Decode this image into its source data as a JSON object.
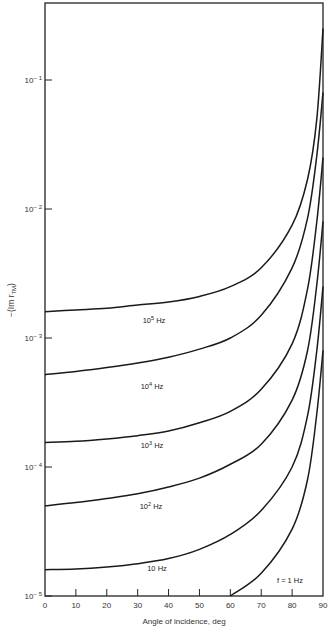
{
  "chart_data": {
    "type": "line",
    "title": "",
    "xlabel": "Angle of incidence, deg",
    "ylabel": "-(Im r_TM)",
    "yscale": "log",
    "xlim": [
      0,
      90
    ],
    "ylim": [
      1e-05,
      0.3
    ],
    "grid": false,
    "legend": "inline labels on curves",
    "x_ticks": [
      0,
      10,
      20,
      30,
      40,
      50,
      60,
      70,
      80,
      90
    ],
    "y_ticks": [
      {
        "value": 0.1,
        "label": "10^-1"
      },
      {
        "value": 0.01,
        "label": "10^-2"
      },
      {
        "value": 0.001,
        "label": "10^-3"
      },
      {
        "value": 0.0001,
        "label": "10^-4"
      },
      {
        "value": 1e-05,
        "label": "10^-5"
      }
    ],
    "x": [
      0,
      10,
      20,
      30,
      40,
      50,
      60,
      70,
      80,
      85,
      88,
      90
    ],
    "series": [
      {
        "name": "10^5 Hz",
        "label_base": "10",
        "label_exp": "5",
        "label_unit": "Hz",
        "values": [
          0.0016,
          0.00165,
          0.0017,
          0.0018,
          0.0019,
          0.0021,
          0.0025,
          0.0035,
          0.0075,
          0.017,
          0.05,
          0.25
        ]
      },
      {
        "name": "10^4 Hz",
        "label_base": "10",
        "label_exp": "4",
        "label_unit": "Hz",
        "values": [
          0.00052,
          0.00055,
          0.00059,
          0.00064,
          0.00071,
          0.00082,
          0.001,
          0.0015,
          0.0035,
          0.0085,
          0.026,
          0.08
        ]
      },
      {
        "name": "10^3 Hz",
        "label_base": "10",
        "label_exp": "3",
        "label_unit": "Hz",
        "values": [
          0.000155,
          0.000158,
          0.000165,
          0.000175,
          0.00019,
          0.00022,
          0.00027,
          0.0004,
          0.0009,
          0.0024,
          0.008,
          0.025
        ]
      },
      {
        "name": "10^2 Hz",
        "label_base": "10",
        "label_exp": "2",
        "label_unit": "Hz",
        "values": [
          5e-05,
          5.3e-05,
          5.7e-05,
          6.2e-05,
          7e-05,
          8.2e-05,
          0.000105,
          0.00015,
          0.00033,
          0.0008,
          0.0026,
          0.008
        ]
      },
      {
        "name": "10 Hz",
        "label_base": "10",
        "label_exp": "",
        "label_unit": "Hz",
        "values": [
          1.6e-05,
          1.62e-05,
          1.68e-05,
          1.78e-05,
          1.95e-05,
          2.3e-05,
          3e-05,
          4.6e-05,
          0.0001,
          0.00025,
          0.0008,
          0.0025
        ]
      },
      {
        "name": "f = 1 Hz",
        "label_base": "f = 1",
        "label_exp": "",
        "label_unit": "Hz",
        "values": [
          null,
          null,
          null,
          null,
          null,
          null,
          1e-05,
          1.5e-05,
          3.3e-05,
          8e-05,
          0.00026,
          0.0008
        ]
      }
    ]
  }
}
